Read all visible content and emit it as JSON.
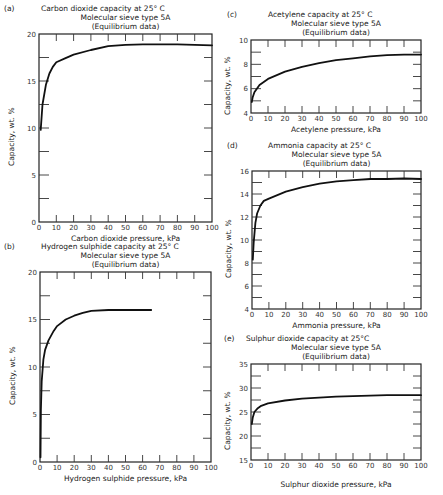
{
  "chart_data": [
    {
      "id": "a",
      "type": "line",
      "panel_label": "(a)",
      "title": "Carbon  dioxide capacity at 25° C",
      "subtitle": "Molecular sieve type 5A",
      "subtitle2": "(Equilibrium data)",
      "xlabel": "Carbon dioxide pressure, kPa",
      "ylabel": "Capacity,    wt. %",
      "xlim": [
        0,
        100
      ],
      "ylim": [
        0,
        20
      ],
      "xticks": [
        0,
        10,
        20,
        30,
        40,
        50,
        60,
        70,
        80,
        90,
        100
      ],
      "yticks": [
        0,
        5,
        10,
        15,
        20
      ],
      "x": [
        1,
        2,
        4,
        6,
        8,
        10,
        15,
        20,
        30,
        40,
        50,
        60,
        70,
        80,
        90,
        100
      ],
      "values": [
        9.8,
        12.5,
        14.6,
        15.8,
        16.5,
        17.0,
        17.4,
        17.8,
        18.3,
        18.7,
        18.85,
        18.9,
        18.9,
        18.9,
        18.85,
        18.8
      ]
    },
    {
      "id": "b",
      "type": "line",
      "panel_label": "(b)",
      "title": "Hydrogen  sulphide capacity at 25° C",
      "subtitle": "Molecular sieve type 5A",
      "subtitle2": "(Equilibrium data)",
      "xlabel": "Hydrogen sulphide pressure, kPa",
      "ylabel": "Capacity,    wt.  %",
      "xlim": [
        0,
        100
      ],
      "ylim": [
        0,
        20
      ],
      "xticks": [
        0,
        10,
        20,
        30,
        40,
        50,
        60,
        70,
        80,
        90,
        100
      ],
      "yticks": [
        0,
        5,
        10,
        15,
        20
      ],
      "x": [
        0.3,
        0.5,
        1,
        2,
        3,
        5,
        8,
        10,
        15,
        20,
        25,
        30,
        40,
        50,
        60,
        65
      ],
      "values": [
        0.5,
        5.5,
        8.5,
        10.8,
        11.8,
        12.8,
        13.8,
        14.3,
        15.0,
        15.4,
        15.7,
        15.9,
        16.0,
        16.0,
        16.0,
        16.0
      ]
    },
    {
      "id": "c",
      "type": "line",
      "panel_label": "(c)",
      "title": "Acetylene  capacity at 25° C",
      "subtitle": "Molecular sieve type 5A",
      "subtitle2": "(Equilibrium data)",
      "xlabel": "Acetylene pressure,  kPa",
      "ylabel": "Capacity,  wt.  %",
      "xlim": [
        0,
        100
      ],
      "ylim": [
        4,
        10
      ],
      "xticks": [
        0,
        10,
        20,
        30,
        40,
        50,
        60,
        70,
        80,
        90,
        100
      ],
      "yticks": [
        4,
        6,
        8,
        10
      ],
      "x": [
        0.5,
        1,
        2,
        5,
        10,
        20,
        30,
        40,
        50,
        60,
        70,
        80,
        90,
        100
      ],
      "values": [
        4.9,
        5.3,
        5.7,
        6.3,
        6.8,
        7.4,
        7.8,
        8.1,
        8.35,
        8.5,
        8.65,
        8.75,
        8.8,
        8.8
      ]
    },
    {
      "id": "d",
      "type": "line",
      "panel_label": "(d)",
      "title": "Ammonia  capacity at 25° C",
      "subtitle": "Molecular sieve type 5A",
      "subtitle2": "(Equilibrium data)",
      "xlabel": "Ammonia pressure,  kPa",
      "ylabel": "Capacity, wt.  %",
      "xlim": [
        0,
        100
      ],
      "ylim": [
        4,
        16
      ],
      "xticks": [
        0,
        10,
        20,
        30,
        40,
        50,
        60,
        70,
        80,
        90,
        100
      ],
      "yticks": [
        4,
        6,
        8,
        10,
        12,
        14,
        16
      ],
      "x": [
        0.5,
        1,
        2,
        3,
        5,
        7,
        10,
        20,
        30,
        40,
        50,
        60,
        70,
        80,
        90,
        100
      ],
      "values": [
        8.3,
        9.8,
        11.5,
        12.3,
        13.0,
        13.4,
        13.6,
        14.2,
        14.6,
        14.9,
        15.1,
        15.2,
        15.3,
        15.3,
        15.35,
        15.3
      ]
    },
    {
      "id": "e",
      "type": "line",
      "panel_label": "(e)",
      "title": "Sulphur  dioxide capacity at 25°C",
      "subtitle": "Molecular sieve type 5A",
      "subtitle2": "(Equilibrium data)",
      "xlabel": "Sulphur dioxide pressure,  kPa",
      "ylabel": "Capacity,  wt. %",
      "xlim": [
        0,
        100
      ],
      "ylim": [
        15,
        35
      ],
      "xticks": [
        0,
        10,
        20,
        30,
        40,
        50,
        60,
        70,
        80,
        90,
        100
      ],
      "yticks": [
        15,
        20,
        25,
        30,
        35
      ],
      "x": [
        0.5,
        1,
        2,
        4,
        6,
        10,
        20,
        30,
        40,
        50,
        60,
        70,
        80,
        90,
        100
      ],
      "values": [
        22.5,
        23.8,
        25.0,
        25.8,
        26.3,
        26.8,
        27.4,
        27.8,
        28.0,
        28.2,
        28.3,
        28.4,
        28.5,
        28.5,
        28.5
      ]
    }
  ],
  "layout_boxes": {
    "a": {
      "x0": 39,
      "y0": 34,
      "x1": 212,
      "y1": 222
    },
    "b": {
      "x0": 40,
      "y0": 272,
      "x1": 211,
      "y1": 462
    },
    "c": {
      "x0": 251,
      "y0": 40,
      "x1": 421,
      "y1": 113
    },
    "d": {
      "x0": 252,
      "y0": 171,
      "x1": 421,
      "y1": 309
    },
    "e": {
      "x0": 251,
      "y0": 364,
      "x1": 421,
      "y1": 460
    }
  }
}
